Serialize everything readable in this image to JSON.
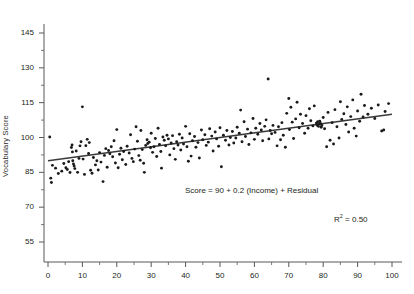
{
  "figure": {
    "title_fragment": "",
    "background": "#ffffff",
    "point_color": "#1a1a1a",
    "line_color": "#3a3a3a",
    "axis_color": "#58585a"
  },
  "annotations": {
    "equation": "Score = 90 + 0.2 (Income) + Residual",
    "r2_prefix": "R",
    "r2_superscript": "2",
    "r2_value": "= 0.50"
  },
  "chart_data": {
    "type": "scatter",
    "title": "",
    "xlabel": "",
    "ylabel": "Vocabulary Score",
    "xlim": [
      0,
      100
    ],
    "ylim": [
      55,
      148
    ],
    "grid": false,
    "legend": null,
    "xticks": [
      0,
      10,
      20,
      30,
      40,
      50,
      60,
      70,
      80,
      90,
      100
    ],
    "xtick_labels": [
      "0",
      "10",
      "20",
      "30",
      "40",
      "50",
      "60",
      "70",
      "80",
      "90",
      "100"
    ],
    "x_minor_tick_step": 5,
    "yticks": [
      55,
      70,
      85,
      100,
      115,
      130,
      145
    ],
    "ytick_labels": [
      "55",
      "70",
      "85",
      "100",
      "115",
      "130",
      "145"
    ],
    "y_minor_tick_step": 7.5,
    "fit_line": {
      "intercept": 90,
      "slope": 0.2,
      "x_start": 0,
      "x_end": 100,
      "y_start": 90,
      "y_end": 110,
      "r_squared": 0.5
    },
    "n_points": 205,
    "points": [
      [
        0.5,
        100.2
      ],
      [
        0.8,
        82.5
      ],
      [
        1.0,
        80.6
      ],
      [
        1.3,
        88.0
      ],
      [
        2.2,
        86.8
      ],
      [
        3.0,
        84.5
      ],
      [
        4.0,
        85.5
      ],
      [
        4.6,
        88.8
      ],
      [
        5.2,
        87.0
      ],
      [
        5.6,
        86.2
      ],
      [
        6.0,
        89.6
      ],
      [
        6.4,
        84.9
      ],
      [
        6.8,
        95.7
      ],
      [
        7.0,
        96.8
      ],
      [
        7.1,
        93.8
      ],
      [
        7.2,
        90.0
      ],
      [
        7.4,
        88.6
      ],
      [
        7.6,
        87.7
      ],
      [
        7.8,
        86.6
      ],
      [
        8.2,
        94.2
      ],
      [
        8.6,
        85.0
      ],
      [
        9.0,
        91.0
      ],
      [
        9.3,
        96.4
      ],
      [
        9.6,
        98.2
      ],
      [
        10.0,
        113.2
      ],
      [
        10.2,
        90.7
      ],
      [
        10.6,
        84.1
      ],
      [
        11.0,
        96.5
      ],
      [
        11.4,
        99.2
      ],
      [
        11.8,
        93.1
      ],
      [
        12.0,
        97.8
      ],
      [
        12.4,
        85.9
      ],
      [
        12.8,
        84.6
      ],
      [
        13.2,
        91.4
      ],
      [
        13.8,
        88.2
      ],
      [
        14.2,
        90.0
      ],
      [
        14.6,
        86.0
      ],
      [
        15.0,
        93.5
      ],
      [
        15.4,
        89.4
      ],
      [
        16.0,
        81.0
      ],
      [
        16.4,
        92.3
      ],
      [
        16.8,
        95.2
      ],
      [
        17.2,
        87.2
      ],
      [
        17.6,
        94.4
      ],
      [
        18.0,
        93.0
      ],
      [
        18.4,
        96.0
      ],
      [
        18.8,
        91.7
      ],
      [
        19.2,
        98.6
      ],
      [
        19.6,
        89.0
      ],
      [
        20.0,
        103.4
      ],
      [
        20.4,
        87.0
      ],
      [
        20.8,
        92.8
      ],
      [
        21.2,
        95.4
      ],
      [
        21.6,
        90.4
      ],
      [
        22.0,
        94.0
      ],
      [
        22.6,
        88.4
      ],
      [
        23.0,
        96.2
      ],
      [
        23.6,
        93.3
      ],
      [
        24.0,
        101.2
      ],
      [
        24.4,
        91.0
      ],
      [
        24.8,
        89.6
      ],
      [
        25.2,
        95.0
      ],
      [
        25.6,
        104.6
      ],
      [
        26.0,
        98.4
      ],
      [
        26.4,
        92.2
      ],
      [
        26.8,
        90.2
      ],
      [
        27.0,
        103.0
      ],
      [
        27.4,
        94.8
      ],
      [
        27.8,
        88.9
      ],
      [
        28.0,
        85.0
      ],
      [
        28.4,
        96.6
      ],
      [
        28.8,
        99.0
      ],
      [
        29.0,
        97.4
      ],
      [
        29.4,
        98.0
      ],
      [
        29.8,
        95.6
      ],
      [
        30.0,
        101.8
      ],
      [
        30.4,
        93.6
      ],
      [
        30.8,
        96.0
      ],
      [
        31.2,
        99.6
      ],
      [
        31.6,
        91.8
      ],
      [
        32.0,
        104.0
      ],
      [
        32.4,
        97.0
      ],
      [
        32.8,
        94.0
      ],
      [
        33.0,
        86.8
      ],
      [
        33.4,
        100.2
      ],
      [
        33.8,
        98.8
      ],
      [
        34.2,
        96.4
      ],
      [
        34.6,
        101.0
      ],
      [
        35.0,
        99.4
      ],
      [
        35.4,
        92.5
      ],
      [
        35.8,
        97.6
      ],
      [
        36.2,
        100.8
      ],
      [
        36.6,
        95.2
      ],
      [
        37.0,
        90.6
      ],
      [
        37.4,
        98.2
      ],
      [
        37.8,
        96.8
      ],
      [
        38.2,
        101.4
      ],
      [
        38.6,
        94.6
      ],
      [
        39.0,
        99.8
      ],
      [
        39.4,
        97.2
      ],
      [
        40.0,
        104.8
      ],
      [
        40.4,
        96.0
      ],
      [
        40.8,
        89.8
      ],
      [
        41.2,
        101.6
      ],
      [
        41.6,
        92.0
      ],
      [
        42.0,
        98.6
      ],
      [
        42.6,
        100.4
      ],
      [
        43.0,
        95.8
      ],
      [
        43.6,
        97.8
      ],
      [
        44.0,
        91.2
      ],
      [
        44.6,
        103.2
      ],
      [
        45.0,
        99.0
      ],
      [
        45.6,
        101.2
      ],
      [
        46.0,
        96.6
      ],
      [
        46.6,
        98.0
      ],
      [
        47.0,
        103.8
      ],
      [
        47.6,
        100.6
      ],
      [
        48.0,
        94.2
      ],
      [
        48.6,
        102.4
      ],
      [
        49.0,
        99.4
      ],
      [
        49.6,
        96.2
      ],
      [
        50.0,
        104.2
      ],
      [
        50.4,
        87.4
      ],
      [
        51.0,
        101.0
      ],
      [
        51.6,
        98.8
      ],
      [
        52.0,
        103.0
      ],
      [
        52.6,
        96.8
      ],
      [
        53.0,
        100.0
      ],
      [
        53.6,
        102.6
      ],
      [
        54.0,
        97.6
      ],
      [
        54.6,
        99.8
      ],
      [
        55.0,
        104.4
      ],
      [
        55.6,
        101.8
      ],
      [
        56.0,
        111.8
      ],
      [
        56.4,
        98.2
      ],
      [
        57.0,
        106.8
      ],
      [
        57.4,
        100.4
      ],
      [
        58.0,
        103.6
      ],
      [
        58.4,
        97.0
      ],
      [
        59.0,
        102.0
      ],
      [
        59.6,
        108.2
      ],
      [
        60.0,
        99.2
      ],
      [
        60.4,
        104.0
      ],
      [
        61.0,
        101.4
      ],
      [
        61.6,
        106.0
      ],
      [
        62.0,
        103.2
      ],
      [
        62.4,
        98.6
      ],
      [
        63.0,
        104.8
      ],
      [
        63.4,
        107.6
      ],
      [
        64.0,
        125.2
      ],
      [
        64.2,
        99.4
      ],
      [
        64.6,
        103.0
      ],
      [
        65.0,
        101.6
      ],
      [
        65.4,
        105.2
      ],
      [
        66.0,
        102.2
      ],
      [
        66.6,
        96.4
      ],
      [
        67.0,
        104.6
      ],
      [
        67.6,
        99.0
      ],
      [
        68.0,
        106.4
      ],
      [
        68.4,
        101.0
      ],
      [
        69.0,
        95.8
      ],
      [
        69.4,
        110.4
      ],
      [
        70.0,
        116.8
      ],
      [
        70.2,
        103.4
      ],
      [
        70.6,
        113.0
      ],
      [
        71.0,
        106.6
      ],
      [
        71.4,
        99.6
      ],
      [
        72.0,
        108.0
      ],
      [
        72.4,
        115.2
      ],
      [
        73.0,
        104.2
      ],
      [
        73.4,
        110.0
      ],
      [
        74.0,
        106.0
      ],
      [
        74.6,
        101.8
      ],
      [
        75.0,
        109.4
      ],
      [
        75.6,
        104.0
      ],
      [
        76.0,
        112.4
      ],
      [
        76.4,
        107.2
      ],
      [
        77.0,
        105.0
      ],
      [
        77.4,
        113.6
      ],
      [
        78.0,
        106.2
      ],
      [
        78.2,
        105.4
      ],
      [
        78.4,
        106.8
      ],
      [
        78.6,
        104.8
      ],
      [
        78.8,
        105.8
      ],
      [
        79.0,
        107.0
      ],
      [
        79.2,
        106.0
      ],
      [
        79.4,
        104.4
      ],
      [
        79.6,
        105.2
      ],
      [
        80.0,
        108.6
      ],
      [
        80.4,
        103.8
      ],
      [
        81.0,
        96.0
      ],
      [
        81.4,
        110.8
      ],
      [
        82.0,
        98.8
      ],
      [
        82.6,
        106.4
      ],
      [
        83.0,
        97.2
      ],
      [
        83.4,
        112.0
      ],
      [
        84.0,
        104.6
      ],
      [
        84.6,
        99.8
      ],
      [
        85.0,
        115.4
      ],
      [
        85.4,
        107.8
      ],
      [
        86.0,
        110.2
      ],
      [
        86.6,
        105.6
      ],
      [
        87.0,
        113.2
      ],
      [
        87.4,
        102.4
      ],
      [
        88.0,
        109.0
      ],
      [
        88.6,
        116.2
      ],
      [
        89.0,
        104.0
      ],
      [
        89.6,
        100.6
      ],
      [
        90.0,
        111.4
      ],
      [
        90.6,
        107.0
      ],
      [
        91.0,
        118.6
      ],
      [
        91.6,
        108.8
      ],
      [
        92.0,
        113.8
      ],
      [
        93.0,
        110.0
      ],
      [
        94.0,
        112.6
      ],
      [
        95.0,
        108.2
      ],
      [
        96.0,
        114.0
      ],
      [
        97.0,
        102.8
      ],
      [
        97.6,
        103.2
      ],
      [
        98.0,
        111.2
      ],
      [
        99.0,
        114.6
      ]
    ]
  }
}
